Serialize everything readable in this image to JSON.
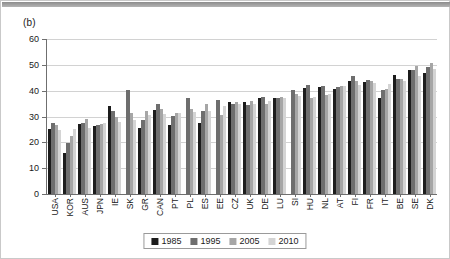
{
  "figure": {
    "panel_label": "(b)"
  },
  "chart_data": {
    "type": "bar",
    "title": "(b)",
    "xlabel": "",
    "ylabel": "",
    "ylim": [
      0,
      60
    ],
    "yticks": [
      0,
      10,
      20,
      30,
      40,
      50,
      60
    ],
    "ytick_labels": [
      "0",
      "10",
      "20",
      "30",
      "40",
      "50",
      "60"
    ],
    "grid": true,
    "legend_position": "bottom-center",
    "categories": [
      "USA",
      "KOR",
      "AUS",
      "JPN",
      "IE",
      "SK",
      "GR",
      "CAN",
      "PT",
      "PL",
      "ES",
      "EE",
      "CZ",
      "UK",
      "DE",
      "LU",
      "SI",
      "HU",
      "NL",
      "AT",
      "FI",
      "FR",
      "IT",
      "BE",
      "SE",
      "DK"
    ],
    "series": [
      {
        "name": "1985",
        "color": "#1c1c1c",
        "values": [
          25.3,
          15.8,
          27.2,
          26.3,
          34.2,
          null,
          25.7,
          32.5,
          26.7,
          null,
          27.5,
          null,
          35.8,
          35.7,
          37.0,
          37.2,
          null,
          41.0,
          41.4,
          40.8,
          43.7,
          43.5,
          37.3,
          46.0,
          48.0,
          47.0
        ]
      },
      {
        "name": "1995",
        "color": "#6e6e6e",
        "values": [
          27.6,
          19.9,
          27.3,
          26.6,
          32.0,
          40.2,
          28.5,
          35.0,
          30.3,
          37.0,
          32.0,
          36.3,
          35.0,
          34.5,
          37.5,
          37.0,
          40.1,
          42.3,
          41.8,
          41.5,
          45.5,
          44.0,
          40.1,
          44.5,
          48.0,
          49.0
        ]
      },
      {
        "name": "2005",
        "color": "#a6a6a6",
        "values": [
          26.8,
          22.5,
          29.0,
          27.0,
          30.0,
          31.5,
          32.0,
          33.0,
          31.4,
          32.8,
          35.0,
          30.6,
          35.5,
          36.0,
          34.8,
          37.6,
          38.6,
          37.3,
          38.4,
          42.0,
          43.9,
          43.9,
          40.6,
          44.6,
          49.5,
          50.8
        ]
      },
      {
        "name": "2010",
        "color": "#d4d4d4",
        "values": [
          24.8,
          25.1,
          25.6,
          27.6,
          28.0,
          28.5,
          30.5,
          31.0,
          31.5,
          31.7,
          32.3,
          34.0,
          34.9,
          35.0,
          36.0,
          37.1,
          38.0,
          37.7,
          38.8,
          42.0,
          42.1,
          42.9,
          42.6,
          43.8,
          45.5,
          48.2
        ]
      }
    ],
    "legend": [
      {
        "label": "1985",
        "color": "#1c1c1c"
      },
      {
        "label": "1995",
        "color": "#6e6e6e"
      },
      {
        "label": "2005",
        "color": "#a6a6a6"
      },
      {
        "label": "2010",
        "color": "#d4d4d4"
      }
    ]
  }
}
